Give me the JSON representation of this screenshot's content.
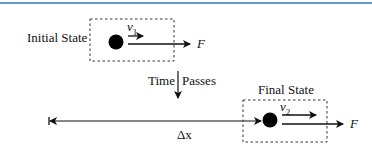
{
  "diagram": {
    "initial_label": "Initial State",
    "final_label": "Final State",
    "time_label_left": "Time",
    "time_label_right": "Passes",
    "v1_symbol": "v",
    "v1_sub": "1",
    "v2_symbol": "v",
    "v2_sub": "2",
    "force_label": "F",
    "displacement_label": "Δx",
    "accent_color": "#5b9bd0"
  }
}
